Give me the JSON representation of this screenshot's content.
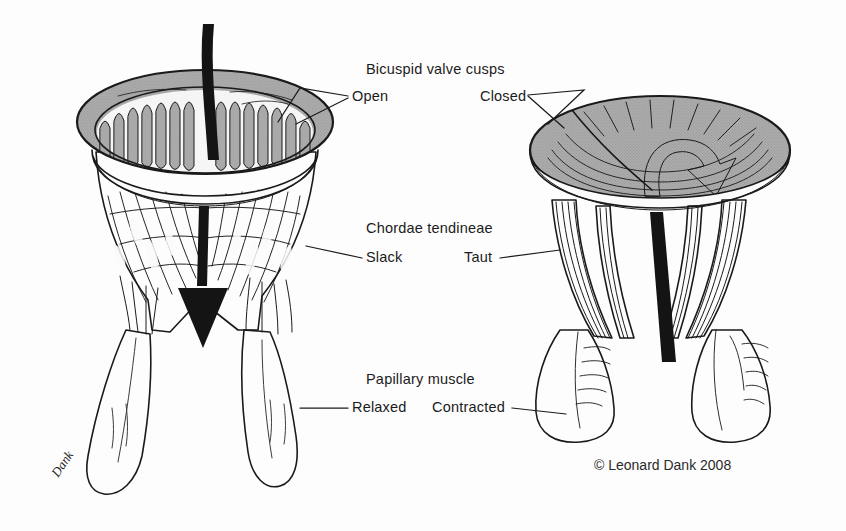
{
  "figure": {
    "credit": "© Leonard Dank 2008",
    "signature": "Dank",
    "background_color": "#fdfdfd",
    "ink_color": "#1a1a1a",
    "tissue_color": "#a9a9a9",
    "arrow_color": "#141414"
  },
  "labels": {
    "cusps_heading": "Bicuspid valve cusps",
    "cusps_left": "Open",
    "cusps_right": "Closed",
    "chordae_heading": "Chordae tendineae",
    "chordae_left": "Slack",
    "chordae_right": "Taut",
    "papillary_heading": "Papillary muscle",
    "papillary_left": "Relaxed",
    "papillary_right": "Contracted"
  },
  "panels": [
    {
      "id": "left-panel",
      "state": "open",
      "cusp_state": "Open",
      "chordae_state": "Slack",
      "papillary_state": "Relaxed",
      "flow_arrow": "straight-down",
      "flow_description": "Blood flows down through the open valve"
    },
    {
      "id": "right-panel",
      "state": "closed",
      "cusp_state": "Closed",
      "chordae_state": "Taut",
      "papillary_state": "Contracted",
      "flow_arrow": "curved-blocked",
      "flow_description": "Backflow is blocked by the closed cusps"
    }
  ]
}
